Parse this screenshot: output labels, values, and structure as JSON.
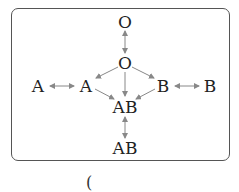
{
  "diagram": {
    "nodes": [
      {
        "id": "o_top",
        "label": "O",
        "x": 125,
        "y": 22
      },
      {
        "id": "o_mid",
        "label": "O",
        "x": 125,
        "y": 63
      },
      {
        "id": "a_left",
        "label": "A",
        "x": 38,
        "y": 86
      },
      {
        "id": "a_mid",
        "label": "A",
        "x": 86,
        "y": 86
      },
      {
        "id": "b_mid",
        "label": "B",
        "x": 163,
        "y": 86
      },
      {
        "id": "b_right",
        "label": "B",
        "x": 210,
        "y": 86
      },
      {
        "id": "ab_mid",
        "label": "AB",
        "x": 125,
        "y": 107
      },
      {
        "id": "ab_bottom",
        "label": "AB",
        "x": 125,
        "y": 148
      }
    ],
    "edges": [
      {
        "from": "o_top",
        "to": "o_mid",
        "type": "double"
      },
      {
        "from": "a_left",
        "to": "a_mid",
        "type": "double"
      },
      {
        "from": "b_mid",
        "to": "b_right",
        "type": "double"
      },
      {
        "from": "ab_mid",
        "to": "ab_bottom",
        "type": "double"
      },
      {
        "from": "o_mid",
        "to": "a_mid",
        "type": "single"
      },
      {
        "from": "o_mid",
        "to": "b_mid",
        "type": "single"
      },
      {
        "from": "o_mid",
        "to": "ab_mid",
        "type": "single"
      },
      {
        "from": "a_mid",
        "to": "ab_mid",
        "type": "single"
      },
      {
        "from": "b_mid",
        "to": "ab_mid",
        "type": "single"
      }
    ],
    "caption_fragment": "(",
    "colors": {
      "arrow": "#888888",
      "text": "#222222",
      "border": "#555555"
    }
  }
}
